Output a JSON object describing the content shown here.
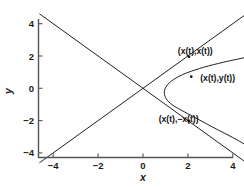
{
  "figure": {
    "background_color": "#fefefe",
    "line_color": "#151515",
    "axis_color": "#555555",
    "text_color": "#111111"
  },
  "chart_data": {
    "type": "line",
    "title": "",
    "xlabel": "x",
    "ylabel": "y",
    "xlim": [
      -4.6,
      4.7
    ],
    "ylim": [
      -4.7,
      4.7
    ],
    "xticks": [
      -4,
      -2,
      0,
      2,
      4
    ],
    "yticks": [
      -4,
      -2,
      0,
      2,
      4
    ],
    "xticklabels": [
      "-4",
      "-2",
      "0",
      "2",
      "4"
    ],
    "yticklabels": [
      "-4",
      "-2",
      "0",
      "2",
      "4"
    ],
    "grid": false,
    "legend": "none",
    "box": false,
    "series": [
      {
        "name": "(x(t),x(t))",
        "description": "straight line y = x",
        "x": [
          -4.6,
          -2.0,
          0.0,
          2.0,
          4.7
        ],
        "y": [
          -4.6,
          -2.0,
          0.0,
          2.0,
          4.7
        ]
      },
      {
        "name": "(x(t),-x(t))",
        "description": "straight line y = -x",
        "x": [
          -4.6,
          -2.0,
          0.0,
          2.0,
          4.7
        ],
        "y": [
          4.6,
          2.0,
          0.0,
          -2.0,
          -4.7
        ]
      },
      {
        "name": "(x(t),y(t))",
        "description": "sideways parabola opening rightward, vertex near (0.95,-0.30)",
        "x": [
          4.7,
          3.6,
          2.7,
          2.0,
          1.55,
          1.22,
          1.02,
          0.95,
          1.05,
          1.3,
          1.7,
          2.3,
          3.1,
          4.0,
          4.7
        ],
        "y": [
          1.95,
          1.62,
          1.3,
          0.98,
          0.7,
          0.4,
          0.08,
          -0.3,
          -0.68,
          -1.02,
          -1.35,
          -1.8,
          -2.4,
          -3.05,
          -3.6
        ]
      }
    ],
    "annotations": [
      {
        "text": "(x(t),x(t))",
        "label_x": 1.55,
        "label_y": 2.12,
        "anchor_x": 2.05,
        "anchor_y": 1.95
      },
      {
        "text": "(x(t),y(t))",
        "label_x": 2.55,
        "label_y": 0.45,
        "anchor_x": 2.15,
        "anchor_y": 0.72
      },
      {
        "text": "(x(t),-x(t))",
        "label_x": 0.7,
        "label_y": -2.1,
        "anchor_x": 2.05,
        "anchor_y": -2.02
      }
    ]
  }
}
